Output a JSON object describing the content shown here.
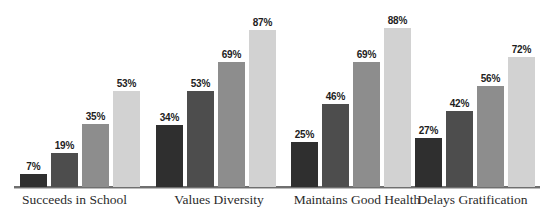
{
  "chart_data": {
    "type": "bar",
    "title": "",
    "subtitle": "",
    "xlabel": "",
    "ylabel": "",
    "ylim": [
      0,
      100
    ],
    "grid": false,
    "legend": "none",
    "value_suffix": "%",
    "categories": [
      "Succeeds in School",
      "Values Diversity",
      "Maintains Good Health",
      "Delays Gratification"
    ],
    "series": [
      {
        "name": "series-1",
        "color": "#2f2f2f",
        "values": [
          7,
          34,
          25,
          27
        ]
      },
      {
        "name": "series-2",
        "color": "#4d4d4d",
        "values": [
          19,
          53,
          46,
          42
        ]
      },
      {
        "name": "series-3",
        "color": "#8d8d8d",
        "values": [
          35,
          69,
          69,
          56
        ]
      },
      {
        "name": "series-4",
        "color": "#d2d2d2",
        "values": [
          53,
          87,
          88,
          72
        ]
      }
    ],
    "data_labels": [
      [
        "7%",
        "19%",
        "35%",
        "53%"
      ],
      [
        "34%",
        "53%",
        "69%",
        "87%"
      ],
      [
        "25%",
        "46%",
        "69%",
        "88%"
      ],
      [
        "27%",
        "42%",
        "56%",
        "72%"
      ]
    ],
    "axis_color": "#6f6f6f"
  },
  "layout": {
    "group_left": [
      20,
      156,
      291,
      415
    ],
    "bar_width": 27,
    "bar_gap": 4,
    "baseline_y": 187,
    "px_per_percent": 1.81,
    "category_label_left": [
      12,
      164,
      287,
      410
    ],
    "category_label_width": [
      125,
      110,
      140,
      125
    ]
  }
}
